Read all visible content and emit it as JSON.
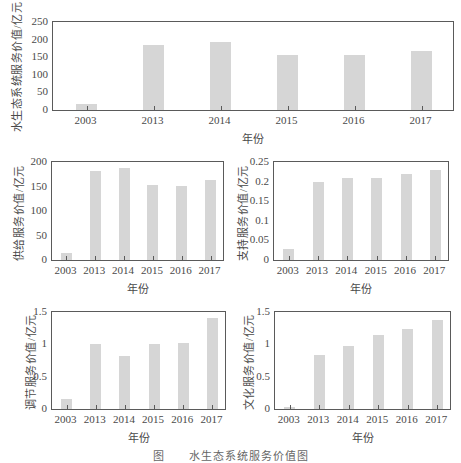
{
  "chart_data": [
    {
      "type": "bar",
      "title": "",
      "xlabel": "年份",
      "ylabel": "水生态系统服务价值/亿元",
      "categories": [
        "2003",
        "2013",
        "2014",
        "2015",
        "2016",
        "2017"
      ],
      "values": [
        18,
        185,
        194,
        157,
        155,
        168
      ],
      "ylim": [
        0,
        250
      ],
      "yticks": [
        "0",
        "50",
        "100",
        "150",
        "200",
        "250"
      ],
      "grid": false
    },
    {
      "type": "bar",
      "title": "",
      "xlabel": "年份",
      "ylabel": "供给服务价值/亿元",
      "categories": [
        "2003",
        "2013",
        "2014",
        "2015",
        "2016",
        "2017"
      ],
      "values": [
        14,
        181,
        188,
        153,
        151,
        163
      ],
      "ylim": [
        0,
        200
      ],
      "yticks": [
        "0",
        "50",
        "100",
        "150",
        "200"
      ],
      "grid": false
    },
    {
      "type": "bar",
      "title": "",
      "xlabel": "年份",
      "ylabel": "支持服务价值/亿元",
      "categories": [
        "2003",
        "2013",
        "2014",
        "2015",
        "2016",
        "2017"
      ],
      "values": [
        0.028,
        0.198,
        0.208,
        0.21,
        0.219,
        0.23
      ],
      "ylim": [
        0,
        0.25
      ],
      "yticks": [
        "0",
        "0.05",
        "0.1",
        "0.15",
        "0.2",
        "0.25"
      ],
      "grid": false
    },
    {
      "type": "bar",
      "title": "",
      "xlabel": "年份",
      "ylabel": "调节服务价值/亿元",
      "categories": [
        "2003",
        "2013",
        "2014",
        "2015",
        "2016",
        "2017"
      ],
      "values": [
        0.15,
        1.0,
        0.82,
        1.0,
        1.02,
        1.4
      ],
      "ylim": [
        0,
        1.5
      ],
      "yticks": [
        "0",
        "0.5",
        "1",
        "1.5"
      ],
      "grid": false
    },
    {
      "type": "bar",
      "title": "",
      "xlabel": "年份",
      "ylabel": "文化服务价值/亿元",
      "categories": [
        "2003",
        "2013",
        "2014",
        "2015",
        "2016",
        "2017"
      ],
      "values": [
        0.03,
        0.84,
        0.98,
        1.14,
        1.24,
        1.37
      ],
      "ylim": [
        0,
        1.5
      ],
      "yticks": [
        "0",
        "0.5",
        "1",
        "1.5"
      ],
      "grid": false
    }
  ],
  "layout": [
    {
      "left": 52,
      "top": 21,
      "width": 402,
      "height": 90,
      "barWidth": 21,
      "ytitleX": 8
    },
    {
      "left": 51,
      "top": 161,
      "width": 173,
      "height": 100,
      "barWidth": 11,
      "ytitleX": 10
    },
    {
      "left": 273,
      "top": 161,
      "width": 176,
      "height": 100,
      "barWidth": 11,
      "ytitleX": 234
    },
    {
      "left": 51,
      "top": 311,
      "width": 175,
      "height": 99,
      "barWidth": 11,
      "ytitleX": 22
    },
    {
      "left": 274,
      "top": 311,
      "width": 177,
      "height": 99,
      "barWidth": 11,
      "ytitleX": 240
    }
  ],
  "colors": {
    "bar": "#d6d6d6",
    "axis": "#5a5a5a",
    "text": "#4a4a4a"
  },
  "caption": "图　　水生态系统服务价值图"
}
